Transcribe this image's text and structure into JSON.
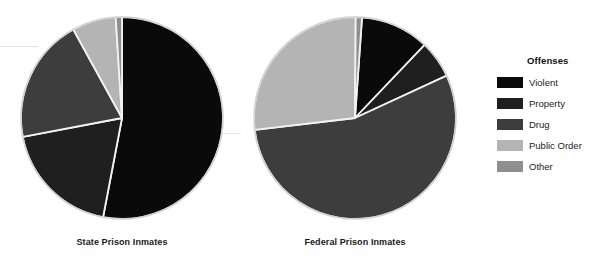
{
  "chart_data": {
    "type": "pie",
    "title": "",
    "legend_title": "Offenses",
    "legend_position": "right",
    "categories": [
      "Violent",
      "Property",
      "Drug",
      "Public Order",
      "Other"
    ],
    "colors": [
      "#0a0a0a",
      "#1f1f1f",
      "#3d3d3d",
      "#b4b4b4",
      "#8f8f8f"
    ],
    "charts": [
      {
        "label": "State Prison Inmates",
        "values": [
          53,
          19,
          20,
          7,
          1
        ],
        "center_x": 122,
        "center_y": 118,
        "radius": 101,
        "start_angle": 0
      },
      {
        "label": "Federal Prison Inmates",
        "values": [
          11,
          6,
          55,
          27,
          1
        ],
        "center_x": 355,
        "center_y": 118,
        "radius": 101,
        "start_angle": 4
      }
    ]
  },
  "legend": {
    "title": "Offenses",
    "items": [
      {
        "label": "Violent",
        "color": "#0a0a0a"
      },
      {
        "label": "Property",
        "color": "#1f1f1f"
      },
      {
        "label": "Drug",
        "color": "#3d3d3d"
      },
      {
        "label": "Public Order",
        "color": "#b4b4b4"
      },
      {
        "label": "Other",
        "color": "#8f8f8f"
      }
    ]
  },
  "captions": {
    "state": "State Prison Inmates",
    "federal": "Federal Prison Inmates"
  }
}
